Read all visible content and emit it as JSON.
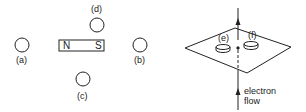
{
  "left_figure": {
    "magnet": {
      "north_label": "N",
      "south_label": "S"
    },
    "compasses": [
      {
        "id": "a",
        "label": "(a)"
      },
      {
        "id": "b",
        "label": "(b)"
      },
      {
        "id": "c",
        "label": "(c)"
      },
      {
        "id": "d",
        "label": "(d)"
      }
    ]
  },
  "right_figure": {
    "compasses": [
      {
        "id": "e",
        "label": "(e)"
      },
      {
        "id": "f",
        "label": "(f)"
      }
    ],
    "flow_label_line1": "electron",
    "flow_label_line2": "flow"
  },
  "colors": {
    "stroke": "#222222",
    "background": "#ffffff"
  }
}
